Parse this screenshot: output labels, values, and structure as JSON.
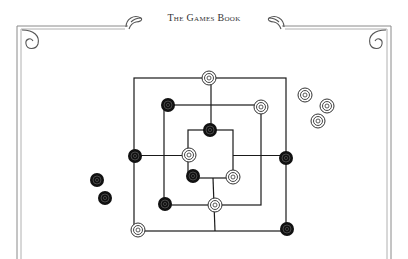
{
  "header": {
    "title": "The Games Book"
  },
  "game": {
    "name": "Nine Men's Morris",
    "colors": {
      "line": "#1a1a1a",
      "black_piece": "#111111",
      "white_piece": "#ffffff",
      "border": "#8a8a8a"
    },
    "board": {
      "outer": {
        "x1": 134,
        "y1": 78,
        "x2": 286,
        "y2": 231
      },
      "middle": {
        "x1": 164,
        "y1": 105,
        "x2": 261,
        "y2": 205
      },
      "inner": {
        "x1": 188,
        "y1": 130,
        "x2": 233,
        "y2": 178
      }
    },
    "pieces_on_board": [
      {
        "color": "white",
        "x": 209,
        "y": 78
      },
      {
        "color": "black",
        "x": 168,
        "y": 105
      },
      {
        "color": "white",
        "x": 261,
        "y": 107
      },
      {
        "color": "black",
        "x": 210,
        "y": 130
      },
      {
        "color": "black",
        "x": 135,
        "y": 156
      },
      {
        "color": "white",
        "x": 189,
        "y": 155
      },
      {
        "color": "black",
        "x": 286,
        "y": 158
      },
      {
        "color": "black",
        "x": 193,
        "y": 176
      },
      {
        "color": "white",
        "x": 233,
        "y": 177
      },
      {
        "color": "black",
        "x": 165,
        "y": 204
      },
      {
        "color": "white",
        "x": 215,
        "y": 205
      },
      {
        "color": "white",
        "x": 138,
        "y": 230
      },
      {
        "color": "black",
        "x": 287,
        "y": 229
      }
    ],
    "pieces_off_board": [
      {
        "color": "white",
        "x": 305,
        "y": 95
      },
      {
        "color": "white",
        "x": 327,
        "y": 106
      },
      {
        "color": "white",
        "x": 318,
        "y": 121
      },
      {
        "color": "black",
        "x": 97,
        "y": 180
      },
      {
        "color": "black",
        "x": 105,
        "y": 198
      }
    ]
  }
}
